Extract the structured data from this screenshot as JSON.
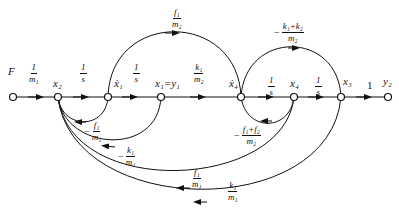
{
  "diagram": {
    "type": "signal-flow-graph",
    "nodes": [
      {
        "id": "F",
        "label": "F",
        "x": 13
      },
      {
        "id": "x2",
        "label": "x₂",
        "x": 58
      },
      {
        "id": "x1dot",
        "label": "ẋ₁",
        "x": 108
      },
      {
        "id": "x1",
        "label": "x₁=y₁",
        "x": 161
      },
      {
        "id": "x4dot",
        "label": "ẋ₄",
        "x": 241
      },
      {
        "id": "x4",
        "label": "x₄",
        "x": 294
      },
      {
        "id": "x3",
        "label": "x₃",
        "x": 341
      },
      {
        "id": "y2",
        "label": "y₂",
        "x": 388
      }
    ],
    "forward_gains": [
      {
        "from": "F",
        "to": "x2",
        "sign": "",
        "num": "1",
        "den": "m₁"
      },
      {
        "from": "x2",
        "to": "x1dot",
        "sign": "",
        "num": "1",
        "den": "s"
      },
      {
        "from": "x1dot",
        "to": "x1",
        "sign": "",
        "num": "1",
        "den": "s"
      },
      {
        "from": "x1",
        "to": "x4dot",
        "sign": "",
        "num": "k₁",
        "den": "m₂"
      },
      {
        "from": "x4dot",
        "to": "x4",
        "sign": "",
        "num": "1",
        "den": "s"
      },
      {
        "from": "x4",
        "to": "x3",
        "sign": "",
        "num": "1",
        "den": "s"
      },
      {
        "from": "x3",
        "to": "y2",
        "plain": "1"
      }
    ],
    "arc_gains": {
      "x1dot_to_x4dot": {
        "sign": "",
        "num": "f₁",
        "den": "m₂"
      },
      "x3_to_x4dot": {
        "sign": "−",
        "num": "k₁+k₂",
        "den": "m₂"
      },
      "x1dot_to_x2": {
        "sign": "−",
        "num": "f₁",
        "den": "m₁"
      },
      "x1_to_x2": {
        "sign": "−",
        "num": "k₁",
        "den": "m₁"
      },
      "x4_to_x4dot": {
        "sign": "−",
        "num": "f₁+f₂",
        "den": "m₂"
      },
      "x4_to_x2": {
        "sign": "",
        "num": "f₁",
        "den": "m₁"
      },
      "x3_to_x2": {
        "sign": "",
        "num": "k₁",
        "den": "m₁"
      }
    },
    "colors": {
      "stroke": "#111111",
      "background": "#ffffff"
    }
  }
}
